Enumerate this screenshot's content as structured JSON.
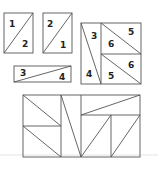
{
  "diagram": {
    "pieces": {
      "rect_a": {
        "top_left": "1",
        "bottom_right": "2"
      },
      "rect_b": {
        "top_left": "2",
        "bottom_right": "1"
      },
      "strip": {
        "left": "3",
        "right": "4"
      },
      "square": {
        "left_top": "3",
        "left_bottom": "4",
        "upper_right": "5",
        "upper_left": "6",
        "lower_right": "6",
        "lower_left": "5"
      }
    },
    "colors": {
      "stroke": "#555555",
      "label": "#222222",
      "background": "#ffffff"
    }
  }
}
